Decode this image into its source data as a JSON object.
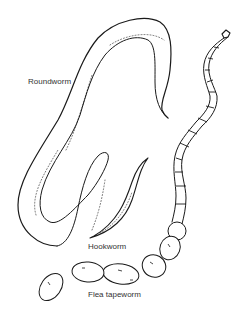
{
  "figure": {
    "ink_color": "#1a1a1a",
    "background": "#ffffff",
    "labels": [
      {
        "id": "roundworm",
        "text": "Roundworm"
      },
      {
        "id": "hookworm",
        "text": "Hookworm"
      },
      {
        "id": "flea_tapeworm",
        "text": "Flea tapeworm"
      }
    ]
  }
}
